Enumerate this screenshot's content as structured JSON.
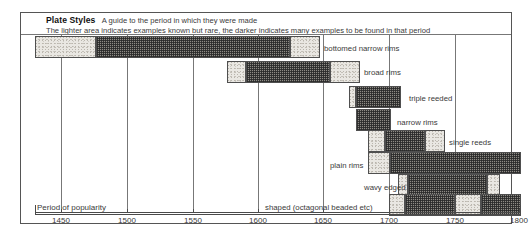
{
  "header": {
    "title": "Plate Styles",
    "subtitle": "A guide to the period in which they were made",
    "note": "The lighter area indicates examples known but rare, the  darker indicates many examples to be found in that period"
  },
  "axis": {
    "title": "Period of popularity",
    "ticks": [
      "1450",
      "1500",
      "1550",
      "1600",
      "1650",
      "1700",
      "1750",
      "1800"
    ],
    "min": 1425,
    "max": 1800
  },
  "chart_data": {
    "type": "bar",
    "title": "Plate Styles",
    "subtitle": "A guide to the period in which they were made",
    "xlabel": "Period of popularity",
    "ylabel": "",
    "xlim": [
      1425,
      1800
    ],
    "grid": true,
    "legend": "The lighter area indicates examples known but rare, the darker indicates many examples to be found in that period",
    "legend_position": "top",
    "orientation": "horizontal-gantt",
    "categories": [
      "bottomed narrow rims",
      "broad rims",
      "triple reeded",
      "narrow rims",
      "single reeds",
      "plain rims",
      "wavy edged",
      "shaped (octagonal beaded etc)"
    ],
    "series": [
      {
        "name": "bottomed narrow rims",
        "rare_start": 1425,
        "common_start": 1472,
        "common_end": 1620,
        "rare_end": 1643
      },
      {
        "name": "broad rims",
        "rare_start": 1572,
        "common_start": 1587,
        "common_end": 1651,
        "rare_end": 1674
      },
      {
        "name": "triple reeded",
        "rare_start": 1665,
        "common_start": 1670,
        "common_end": 1704,
        "rare_end": 1704
      },
      {
        "name": "narrow rims",
        "rare_start": 1670,
        "common_start": 1670,
        "common_end": 1697,
        "rare_end": 1697
      },
      {
        "name": "single reeds",
        "rare_start": 1680,
        "common_start": 1693,
        "common_end": 1724,
        "rare_end": 1739
      },
      {
        "name": "plain rims",
        "rare_start": 1680,
        "common_start": 1697,
        "common_end": 1800,
        "rare_end": 1800
      },
      {
        "name": "wavy edged",
        "rare_start": 1703,
        "common_start": 1711,
        "common_end": 1771,
        "rare_end": 1781
      },
      {
        "name": "shaped (octagonal beaded etc)",
        "rare_start": 1700,
        "common_start": 1712,
        "common_end": 1745,
        "rare_end": 1745,
        "common_start_2": 1769,
        "common_end_2": 1800,
        "rare_start_2": 1745,
        "rare_end_2": 1769
      }
    ]
  },
  "bars": [
    {
      "label": "bottomed narrow rims",
      "label_x": 324,
      "label_y": 44,
      "y": 36,
      "segments": [
        {
          "kind": "light",
          "x": 35,
          "w": 61
        },
        {
          "kind": "dark",
          "x": 96,
          "w": 194
        },
        {
          "kind": "light",
          "x": 290,
          "w": 30
        }
      ],
      "dividers": [
        61,
        127,
        193,
        258
      ]
    },
    {
      "label": "broad rims",
      "label_x": 364,
      "label_y": 68,
      "y": 61,
      "segments": [
        {
          "kind": "light",
          "x": 227,
          "w": 19
        },
        {
          "kind": "dark",
          "x": 246,
          "w": 84
        },
        {
          "kind": "light",
          "x": 330,
          "w": 30
        }
      ],
      "dividers": [
        258,
        323
      ]
    },
    {
      "label": "triple reeded",
      "label_x": 409,
      "label_y": 94,
      "y": 86,
      "segments": [
        {
          "kind": "light",
          "x": 349,
          "w": 7
        },
        {
          "kind": "dark",
          "x": 356,
          "w": 45
        }
      ],
      "dividers": [
        389
      ]
    },
    {
      "label": "narrow rims",
      "label_x": 397,
      "label_y": 118,
      "y": 109,
      "segments": [
        {
          "kind": "dark",
          "x": 356,
          "w": 35
        }
      ],
      "dividers": [
        389
      ]
    },
    {
      "label": "single reeds",
      "label_x": 449,
      "label_y": 138,
      "y": 130,
      "segments": [
        {
          "kind": "light",
          "x": 368,
          "w": 17
        },
        {
          "kind": "dark",
          "x": 385,
          "w": 40
        },
        {
          "kind": "light",
          "x": 425,
          "w": 20
        }
      ],
      "dividers": [
        389
      ]
    },
    {
      "label": "plain rims",
      "label_x": 330,
      "label_y": 161,
      "y": 152,
      "segments": [
        {
          "kind": "light",
          "x": 368,
          "w": 22
        },
        {
          "kind": "dark",
          "x": 390,
          "w": 131
        }
      ],
      "dividers": [
        389,
        455
      ]
    },
    {
      "label": "wavy edged",
      "label_x": 364,
      "label_y": 183,
      "y": 174,
      "segments": [
        {
          "kind": "light",
          "x": 398,
          "w": 10
        },
        {
          "kind": "dark",
          "x": 408,
          "w": 79
        },
        {
          "kind": "light",
          "x": 487,
          "w": 13
        }
      ],
      "dividers": [
        455
      ]
    },
    {
      "label": "shaped (octagonal beaded etc)",
      "label_x": 265,
      "label_y": 203,
      "y": 194,
      "segments": [
        {
          "kind": "light",
          "x": 389,
          "w": 16
        },
        {
          "kind": "dark",
          "x": 405,
          "w": 50
        },
        {
          "kind": "light",
          "x": 455,
          "w": 26
        },
        {
          "kind": "dark",
          "x": 481,
          "w": 40
        }
      ],
      "dividers": [
        455
      ]
    }
  ],
  "gridlines": [
    {
      "x": 61,
      "top": 35,
      "h": 177
    },
    {
      "x": 127,
      "top": 35,
      "h": 177
    },
    {
      "x": 193,
      "top": 35,
      "h": 177
    },
    {
      "x": 258,
      "top": 35,
      "h": 177
    },
    {
      "x": 323,
      "top": 35,
      "h": 177
    },
    {
      "x": 389,
      "top": 35,
      "h": 177
    },
    {
      "x": 455,
      "top": 35,
      "h": 177
    }
  ],
  "tickmarks": [
    {
      "x": 61,
      "label": "1450"
    },
    {
      "x": 127,
      "label": "1500"
    },
    {
      "x": 193,
      "label": "1550"
    },
    {
      "x": 258,
      "label": "1600"
    },
    {
      "x": 323,
      "label": "1650"
    },
    {
      "x": 389,
      "label": "1700"
    },
    {
      "x": 455,
      "label": "1750"
    },
    {
      "x": 519,
      "label": "1800"
    }
  ]
}
